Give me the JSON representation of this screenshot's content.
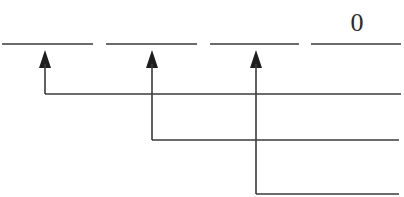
{
  "diagram": {
    "type": "digit-place-value-arrows",
    "blanks": [
      {
        "id": "blank-1",
        "x1": 2,
        "x2": 93,
        "y": 44,
        "value": ""
      },
      {
        "id": "blank-2",
        "x1": 106,
        "x2": 197,
        "y": 44,
        "value": ""
      },
      {
        "id": "blank-3",
        "x1": 210,
        "x2": 299,
        "y": 44,
        "value": ""
      },
      {
        "id": "blank-4",
        "x1": 311,
        "x2": 401,
        "y": 44,
        "value": "0"
      }
    ],
    "arrows": [
      {
        "id": "arrow-1",
        "x": 45,
        "tip_y": 50,
        "bottom_y": 94,
        "line_end_x": 401
      },
      {
        "id": "arrow-2",
        "x": 152,
        "tip_y": 50,
        "bottom_y": 140,
        "line_end_x": 399
      },
      {
        "id": "arrow-3",
        "x": 256,
        "tip_y": 50,
        "bottom_y": 194,
        "line_end_x": 399
      }
    ],
    "colors": {
      "line": "#3a3a3a",
      "arrowhead": "#1e1e1e",
      "text": "#2a2a2a",
      "background": "#ffffff"
    }
  }
}
